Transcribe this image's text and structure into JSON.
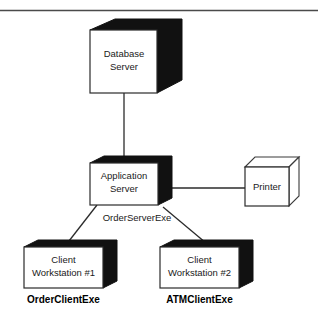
{
  "figure": {
    "width": 318,
    "height": 327,
    "background_color": "#ffffff",
    "line_color": "#2b2b2b",
    "solid_face_color": "#111111",
    "rule_color": "#4a4a4a"
  },
  "nodes": [
    {
      "id": "database-server",
      "label_line1": "Database",
      "label_line2": "Server",
      "style": "solid-shaded-cube"
    },
    {
      "id": "application-server",
      "label_line1": "Application",
      "label_line2": "Server",
      "style": "solid-shaded-cube"
    },
    {
      "id": "printer",
      "label_line1": "Printer",
      "label_line2": "",
      "style": "outline-cube"
    },
    {
      "id": "client-workstation-1",
      "label_line1": "Client",
      "label_line2": "Workstation #1",
      "style": "solid-shaded-cube"
    },
    {
      "id": "client-workstation-2",
      "label_line1": "Client",
      "label_line2": "Workstation #2",
      "style": "solid-shaded-cube"
    }
  ],
  "artifacts": [
    {
      "id": "order-server-exe",
      "label": "OrderServerExe",
      "bold": false
    },
    {
      "id": "order-client-exe",
      "label": "OrderClientExe",
      "bold": true
    },
    {
      "id": "atm-client-exe",
      "label": "ATMClientExe",
      "bold": true
    }
  ],
  "connections": [
    {
      "from": "database-server",
      "to": "application-server"
    },
    {
      "from": "application-server",
      "to": "printer"
    },
    {
      "from": "application-server",
      "to": "client-workstation-1"
    },
    {
      "from": "application-server",
      "to": "client-workstation-2"
    }
  ]
}
